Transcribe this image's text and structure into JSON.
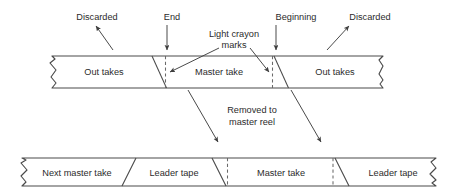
{
  "diagram": {
    "top_tape": {
      "segments": [
        {
          "label": "Out takes"
        },
        {
          "label": "Master take"
        },
        {
          "label": "Out takes"
        }
      ]
    },
    "bottom_tape": {
      "segments": [
        {
          "label": "Next master take"
        },
        {
          "label": "Leader tape"
        },
        {
          "label": "Master take"
        },
        {
          "label": "Leader tape"
        }
      ]
    },
    "annotations": {
      "discarded_left": "Discarded",
      "end": "End",
      "crayon_line1": "Light crayon",
      "crayon_line2": "marks",
      "beginning": "Beginning",
      "discarded_right": "Discarded",
      "removed_line1": "Removed to",
      "removed_line2": "master reel"
    },
    "colors": {
      "ink": "#2b2b2b",
      "stroke": "#4a4a4a",
      "crayon": "#6a6a6a",
      "paper": "#ffffff"
    }
  }
}
